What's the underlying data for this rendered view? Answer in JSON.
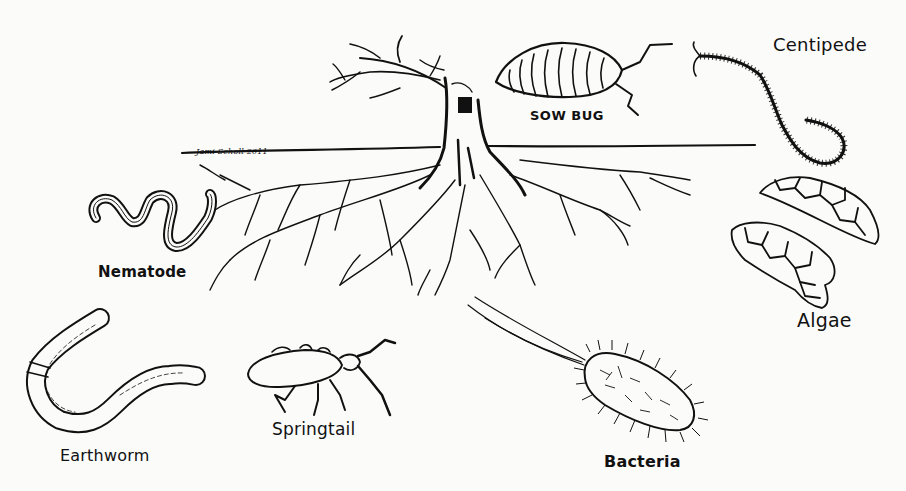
{
  "diagram": {
    "signature": "Jami Scholl 2011",
    "labels": {
      "sow_bug": "SOW BUG",
      "centipede": "Centipede",
      "nematode": "Nematode",
      "algae": "Algae",
      "earthworm": "Earthworm",
      "springtail": "Springtail",
      "bacteria": "Bacteria"
    },
    "colors": {
      "ink": "#111111",
      "paper": "#fbfbfa"
    }
  }
}
